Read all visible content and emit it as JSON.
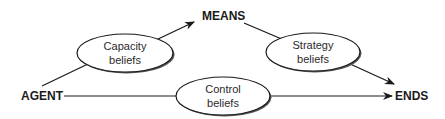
{
  "nodes": {
    "agent": "AGENT",
    "means": "MEANS",
    "ends": "ENDS"
  },
  "beliefs": {
    "capacity": {
      "line1": "Capacity",
      "line2": "beliefs"
    },
    "strategy": {
      "line1": "Strategy",
      "line2": "beliefs"
    },
    "control": {
      "line1": "Control",
      "line2": "beliefs"
    }
  },
  "colors": {
    "line": "#1a1a1a",
    "ellipse_fill": "#ffffff",
    "ellipse_shadow": "#555555"
  }
}
